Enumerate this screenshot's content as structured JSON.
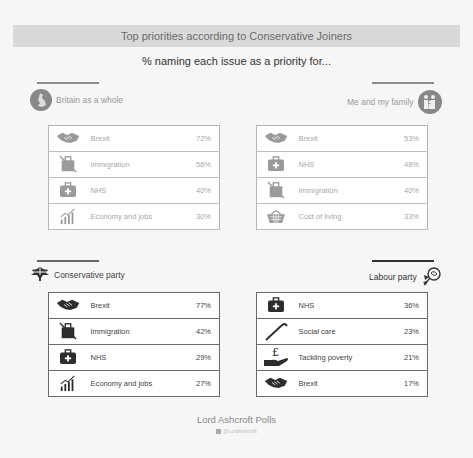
{
  "header": {
    "title": "Top priorities according to Conservative Joiners",
    "subtitle": "% naming each issue as a priority for..."
  },
  "panels": {
    "britain": {
      "heading": "Britain as a whole",
      "icon": "britain-map-icon",
      "rows": [
        {
          "icon": "handshake-icon",
          "label": "Brexit",
          "value": "72%"
        },
        {
          "icon": "immigration-icon",
          "label": "Immigration",
          "value": "56%"
        },
        {
          "icon": "medical-kit-icon",
          "label": "NHS",
          "value": "40%"
        },
        {
          "icon": "economy-chart-icon",
          "label": "Economy and jobs",
          "value": "30%"
        }
      ]
    },
    "family": {
      "heading": "Me and my family",
      "icon": "family-icon",
      "rows": [
        {
          "icon": "handshake-icon",
          "label": "Brexit",
          "value": "53%"
        },
        {
          "icon": "medical-kit-icon",
          "label": "NHS",
          "value": "48%"
        },
        {
          "icon": "immigration-icon",
          "label": "Immigration",
          "value": "40%"
        },
        {
          "icon": "shopping-basket-icon",
          "label": "Cost of living",
          "value": "33%"
        }
      ]
    },
    "conservative": {
      "heading": "Conservative party",
      "icon": "conservative-tree-icon",
      "rows": [
        {
          "icon": "handshake-icon",
          "label": "Brexit",
          "value": "77%"
        },
        {
          "icon": "immigration-icon",
          "label": "Immigration",
          "value": "42%"
        },
        {
          "icon": "medical-kit-icon",
          "label": "NHS",
          "value": "29%"
        },
        {
          "icon": "economy-chart-icon",
          "label": "Economy and jobs",
          "value": "27%"
        }
      ]
    },
    "labour": {
      "heading": "Labour party",
      "icon": "labour-rose-icon",
      "rows": [
        {
          "icon": "medical-kit-icon",
          "label": "NHS",
          "value": "36%"
        },
        {
          "icon": "walking-cane-icon",
          "label": "Social care",
          "value": "23%"
        },
        {
          "icon": "pound-hand-icon",
          "label": "Tackling poverty",
          "value": "21%"
        },
        {
          "icon": "handshake-icon",
          "label": "Brexit",
          "value": "17%"
        }
      ]
    }
  },
  "footer": {
    "brand": "Lord Ashcroft Polls",
    "handle": "@LordAshcroft"
  },
  "colors": {
    "background": "#f6f6f6",
    "title_bar": "#d9d9d9",
    "grey_text": "#a8a8a8",
    "dark_text": "#333333"
  }
}
